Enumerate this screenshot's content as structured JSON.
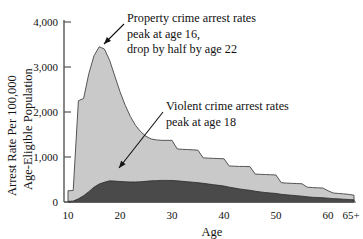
{
  "chart_data": {
    "type": "area",
    "title": "",
    "subtitle": "",
    "xlabel": "Age",
    "ylabel": "Arrest Rate Per 100,000 Age-Eligible Population",
    "ylabel_line1": "Arrest Rate Per 100,000",
    "ylabel_line2": "Age-Eligible Population",
    "xlim": [
      10,
      66
    ],
    "ylim": [
      0,
      4000
    ],
    "grid": false,
    "legend_position": "none",
    "stacked": false,
    "y_ticks": [
      0,
      1000,
      2000,
      3000,
      4000
    ],
    "y_tick_labels": [
      "0",
      "1,000",
      "2,000",
      "3,000",
      "4,000"
    ],
    "x_ticks": [
      10,
      20,
      30,
      40,
      50,
      60,
      65
    ],
    "x_tick_labels": [
      "10",
      "20",
      "30",
      "40",
      "50",
      "60",
      "65+"
    ],
    "x": [
      10,
      11,
      12,
      13,
      14,
      15,
      16,
      17,
      18,
      19,
      20,
      21,
      22,
      23,
      24,
      25,
      26,
      27,
      28,
      29,
      30,
      31,
      32,
      33,
      34,
      35,
      36,
      37,
      38,
      39,
      40,
      41,
      42,
      43,
      44,
      45,
      46,
      47,
      48,
      49,
      50,
      51,
      52,
      53,
      54,
      55,
      56,
      57,
      58,
      59,
      60,
      61,
      62,
      63,
      64,
      65
    ],
    "series": [
      {
        "name": "Property crime arrest rates",
        "color": "#c9c9c9",
        "edge_color": "#555555",
        "values": [
          250,
          255,
          2250,
          2300,
          2850,
          3250,
          3450,
          3400,
          3150,
          2800,
          2450,
          2150,
          1900,
          1700,
          1560,
          1460,
          1400,
          1380,
          1370,
          1370,
          1370,
          1180,
          1170,
          1165,
          1160,
          1150,
          980,
          975,
          970,
          965,
          960,
          800,
          795,
          790,
          790,
          785,
          620,
          615,
          610,
          605,
          600,
          430,
          420,
          415,
          410,
          405,
          330,
          320,
          315,
          310,
          250,
          200,
          190,
          180,
          170,
          150
        ]
      },
      {
        "name": "Violent crime arrest rates",
        "color": "#4a4a4a",
        "edge_color": "#2a2a2a",
        "values": [
          15,
          20,
          70,
          140,
          230,
          330,
          400,
          440,
          470,
          465,
          455,
          450,
          445,
          445,
          450,
          460,
          470,
          475,
          480,
          480,
          478,
          470,
          460,
          450,
          440,
          430,
          415,
          400,
          385,
          370,
          355,
          330,
          310,
          290,
          275,
          260,
          240,
          225,
          210,
          200,
          190,
          170,
          160,
          150,
          140,
          130,
          115,
          105,
          100,
          95,
          85,
          75,
          70,
          62,
          55,
          48
        ]
      }
    ],
    "annotations": [
      {
        "id": "property-annotation",
        "lines": [
          "Property crime arrest rates",
          "peak at age 16,",
          "drop by half by age 22"
        ],
        "text_x": 127,
        "text_y": 22,
        "arrow_from_x": 124,
        "arrow_from_y": 24,
        "arrow_to_x": 104,
        "arrow_to_y": 44
      },
      {
        "id": "violent-annotation",
        "lines": [
          "Violent crime arrest rates",
          "peak at age 18"
        ],
        "text_x": 166,
        "text_y": 110,
        "arrow_from_x": 163,
        "arrow_from_y": 112,
        "arrow_to_x": 119,
        "arrow_to_y": 168
      }
    ]
  },
  "colors": {
    "background": "#ffffff",
    "axis": "#555555",
    "text": "#111111",
    "property_fill": "#c9c9c9",
    "violent_fill": "#4a4a4a"
  }
}
